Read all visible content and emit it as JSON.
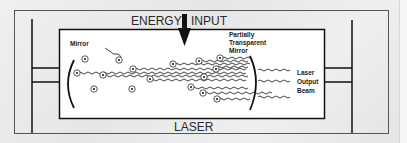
{
  "diagram": {
    "title_top_left": "ENERGY",
    "title_top_right": "INPUT",
    "title_bottom": "LASER",
    "labels": {
      "mirror": "Mirror",
      "partial_mirror_line1": "Partially",
      "partial_mirror_line2": "Transparent",
      "partial_mirror_line3": "Mirror",
      "output_line1": "Laser",
      "output_line2": "Output",
      "output_line3": "Beam"
    },
    "icons": {
      "energy_arrow": "arrow-down-icon",
      "atom": "atom-icon",
      "photon_wave": "wave-icon"
    },
    "colors": {
      "background": "#ebebeb",
      "chamber_fill": "#ffffff",
      "line": "#1a1a1a",
      "text": "#2a2a2a"
    }
  }
}
